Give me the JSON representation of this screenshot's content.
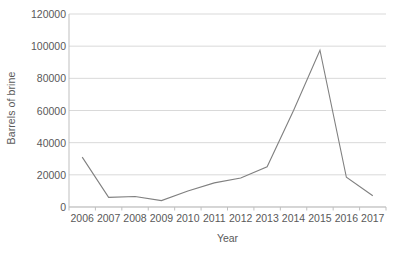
{
  "chart_data": {
    "type": "line",
    "title": "",
    "xlabel": "Year",
    "ylabel": "Barrels of brine",
    "categories": [
      "2006",
      "2007",
      "2008",
      "2009",
      "2010",
      "2011",
      "2012",
      "2013",
      "2014",
      "2015",
      "2016",
      "2017"
    ],
    "values": [
      31000,
      6000,
      6500,
      4000,
      10000,
      15000,
      18000,
      25000,
      60000,
      97500,
      18500,
      7000
    ],
    "series": [
      {
        "name": "Barrels of brine",
        "values": [
          31000,
          6000,
          6500,
          4000,
          10000,
          15000,
          18000,
          25000,
          60000,
          97500,
          18500,
          7000
        ]
      }
    ],
    "ylim": [
      0,
      120000
    ],
    "yticks": [
      0,
      20000,
      40000,
      60000,
      80000,
      100000,
      120000
    ],
    "ytick_labels": [
      "0",
      "20000",
      "40000",
      "60000",
      "80000",
      "100000",
      "120000"
    ],
    "xtick_labels": [
      "2006",
      "2007",
      "2008",
      "2009",
      "2010",
      "2011",
      "2012",
      "2013",
      "2014",
      "2015",
      "2016",
      "2017"
    ],
    "grid": true,
    "grid_axis": "y",
    "legend": false,
    "legend_position": "none",
    "line_color": "#808080",
    "grid_color": "#d9d9d9",
    "axis_color": "#bfbfbf",
    "text_color": "#595959"
  }
}
